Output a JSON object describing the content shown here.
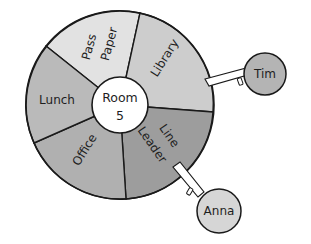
{
  "wheel": {
    "center_label_line1": "Room",
    "center_label_line2": "5",
    "sectors": [
      {
        "label_line1": "Pass",
        "label_line2": "Paper",
        "color": "#e2e2e2"
      },
      {
        "label_line1": "Library",
        "label_line2": "",
        "color": "#cdcdcd"
      },
      {
        "label_line1": "Line",
        "label_line2": "Leader",
        "color": "#9d9d9d"
      },
      {
        "label_line1": "Office",
        "label_line2": "",
        "color": "#b0b0b0"
      },
      {
        "label_line1": "Lunch",
        "label_line2": "",
        "color": "#bababa"
      }
    ]
  },
  "tags": [
    {
      "name": "Tim",
      "assigned_to": "Library",
      "color": "#b4b4b4"
    },
    {
      "name": "Anna",
      "assigned_to": "Line Leader",
      "color": "#d6d6d6"
    }
  ]
}
